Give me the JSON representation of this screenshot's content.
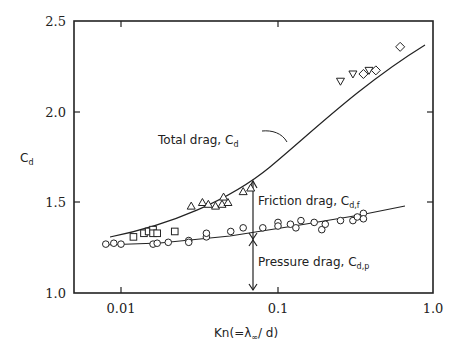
{
  "chart_data": {
    "type": "scatter",
    "title": "",
    "xlabel": "Kn(=λ∞/d)",
    "ylabel": "Cd",
    "xscale": "log",
    "xlim": [
      0.005,
      1.0
    ],
    "ylim": [
      1.0,
      2.5
    ],
    "x_ticks": [
      "0.01",
      "0.1",
      "1.0"
    ],
    "y_ticks": [
      "1.0",
      "1.5",
      "2.0",
      "2.5"
    ],
    "grid": false,
    "legend": null,
    "curves": [
      {
        "name": "Total drag, Cd",
        "x": [
          0.012,
          0.02,
          0.03,
          0.05,
          0.07,
          0.1,
          0.15,
          0.2,
          0.3,
          0.4,
          0.6
        ],
        "y": [
          1.31,
          1.37,
          1.43,
          1.53,
          1.61,
          1.71,
          1.84,
          1.95,
          2.11,
          2.22,
          2.36
        ]
      },
      {
        "name": "Pressure drag curve",
        "x": [
          0.008,
          0.015,
          0.03,
          0.07,
          0.15,
          0.3,
          0.7
        ],
        "y": [
          1.265,
          1.27,
          1.29,
          1.335,
          1.38,
          1.42,
          1.48
        ]
      }
    ],
    "series": [
      {
        "name": "circles",
        "marker": "circle",
        "x": [
          0.008,
          0.009,
          0.01,
          0.016,
          0.017,
          0.02,
          0.027,
          0.027,
          0.035,
          0.035,
          0.05,
          0.06,
          0.08,
          0.1,
          0.1,
          0.12,
          0.13,
          0.14,
          0.17,
          0.19,
          0.2,
          0.25,
          0.3,
          0.32,
          0.35,
          0.35
        ],
        "y": [
          1.27,
          1.275,
          1.27,
          1.27,
          1.275,
          1.28,
          1.29,
          1.28,
          1.31,
          1.33,
          1.34,
          1.36,
          1.36,
          1.39,
          1.37,
          1.38,
          1.36,
          1.4,
          1.39,
          1.35,
          1.38,
          1.4,
          1.4,
          1.42,
          1.44,
          1.41
        ]
      },
      {
        "name": "squares",
        "marker": "square",
        "x": [
          0.012,
          0.014,
          0.015,
          0.016,
          0.016,
          0.017,
          0.022
        ],
        "y": [
          1.31,
          1.33,
          1.34,
          1.35,
          1.33,
          1.33,
          1.34
        ]
      },
      {
        "name": "triangles-up",
        "marker": "triangle-up",
        "x": [
          0.028,
          0.033,
          0.036,
          0.04,
          0.044,
          0.048,
          0.045,
          0.06,
          0.067
        ],
        "y": [
          1.48,
          1.5,
          1.49,
          1.48,
          1.49,
          1.5,
          1.53,
          1.56,
          1.58
        ]
      },
      {
        "name": "triangles-down",
        "marker": "triangle-down",
        "x": [
          0.25,
          0.3,
          0.38
        ],
        "y": [
          2.17,
          2.21,
          2.23
        ]
      },
      {
        "name": "diamonds",
        "marker": "diamond",
        "x": [
          0.35,
          0.42,
          0.6
        ],
        "y": [
          2.21,
          2.23,
          2.36
        ]
      }
    ],
    "annotations": [
      {
        "text": "Total drag, Cd",
        "x": 0.02,
        "y": 1.76
      },
      {
        "text": "Friction drag, Cd,f",
        "x": 0.075,
        "y": 1.48
      },
      {
        "text": "Pressure drag, Cd,p",
        "x": 0.075,
        "y": 1.17
      }
    ],
    "arrow_x": 0.068
  },
  "labels": {
    "y_axis_main": "C",
    "y_axis_sub": "d",
    "x_axis": "Kn(=λ",
    "x_axis_sub": "∞",
    "x_axis_end": "/ d)",
    "ytick_25": "2.5",
    "ytick_20": "2.0",
    "ytick_15": "1.5",
    "ytick_10": "1.0",
    "xtick_001": "0.01",
    "xtick_01": "0.1",
    "xtick_1": "1.0",
    "total_main": "Total drag, C",
    "total_sub": "d",
    "friction_main": "Friction drag, C",
    "friction_sub": "d,f",
    "pressure_main": "Pressure drag, C",
    "pressure_sub": "d,p"
  }
}
